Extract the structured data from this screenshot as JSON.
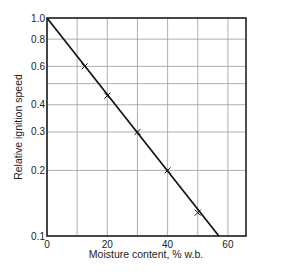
{
  "chart_data": {
    "type": "line",
    "title": "",
    "xlabel": "Moisture content, % w.b.",
    "ylabel": "Relative ignition speed",
    "xlim": [
      0,
      66
    ],
    "ylim": [
      0.1,
      1.0
    ],
    "yscale": "log",
    "grid": true,
    "x_ticks": [
      0,
      20,
      40,
      60
    ],
    "x_gridlines": [
      0,
      10,
      20,
      30,
      40,
      50,
      60
    ],
    "y_ticks": [
      {
        "value": 1.0,
        "label": "1.0"
      },
      {
        "value": 0.8,
        "label": "0.8"
      },
      {
        "value": 0.6,
        "label": "0.6"
      },
      {
        "value": 0.4,
        "label": "0.4"
      },
      {
        "value": 0.3,
        "label": "0.3"
      },
      {
        "value": 0.2,
        "label": "0.2"
      },
      {
        "value": 0.1,
        "label": "0.1"
      }
    ],
    "y_gridlines": [
      1.0,
      0.8,
      0.6,
      0.5,
      0.4,
      0.3,
      0.2,
      0.1
    ],
    "series": [
      {
        "name": "fitted line",
        "style": "line",
        "x": [
          0,
          57
        ],
        "y": [
          1.0,
          0.1
        ]
      },
      {
        "name": "measured",
        "style": "x-markers",
        "x": [
          12.5,
          20,
          30,
          40,
          50
        ],
        "y": [
          0.6,
          0.44,
          0.3,
          0.2,
          0.128
        ]
      }
    ],
    "colors": {
      "line": "#111111",
      "grid": "#9a9a9a",
      "frame": "#222222"
    }
  }
}
